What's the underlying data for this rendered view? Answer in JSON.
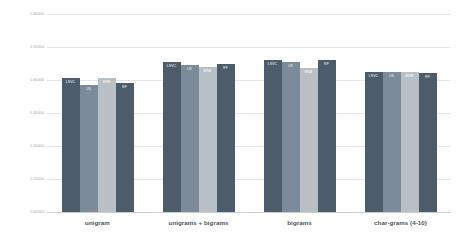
{
  "chart_data": {
    "type": "bar",
    "title": "",
    "xlabel": "",
    "ylabel": "",
    "ylim": [
      0.0,
      0.6
    ],
    "grid": true,
    "legend_position": "none",
    "categories": [
      "unigram",
      "unigrams + bigrams",
      "bigrams",
      "char-grams (4-10)"
    ],
    "ytick_labels": [
      "0.60000",
      "0.50000",
      "0.40000",
      "0.30000",
      "0.20000",
      "0.10000",
      "0.00000"
    ],
    "ytick_values": [
      0.6,
      0.5,
      0.4,
      0.3,
      0.2,
      0.1,
      0.0
    ],
    "series": [
      {
        "name": "LSVC",
        "color": "#4c5c6b",
        "values": [
          0.405,
          0.455,
          0.46,
          0.425
        ]
      },
      {
        "name": "LR",
        "color": "#7c8b99",
        "values": [
          0.385,
          0.445,
          0.455,
          0.425
        ]
      },
      {
        "name": "MNB",
        "color": "#b9c0c5",
        "values": [
          0.405,
          0.44,
          0.435,
          0.425
        ]
      },
      {
        "name": "RF",
        "color": "#4c5c6b",
        "values": [
          0.39,
          0.45,
          0.46,
          0.42
        ]
      }
    ]
  },
  "style": {
    "background": "#ffffff",
    "gridline_color": "#e3e7ea",
    "baseline_color": "#c9ced2",
    "ytick_text_color": "#9aa2a8",
    "xtick_text_color": "#4b5358",
    "bar_label_color": "#ffffff"
  }
}
